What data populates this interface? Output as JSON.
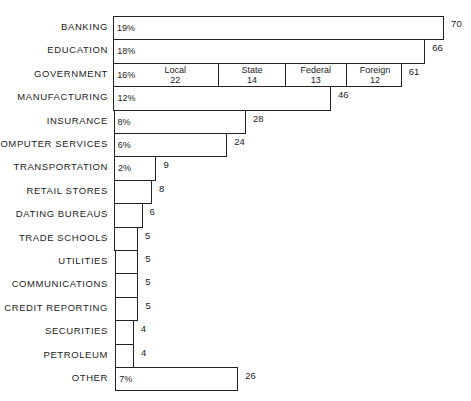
{
  "chart_data": {
    "type": "bar",
    "orientation": "horizontal",
    "title": "",
    "xlabel": "",
    "ylabel": "",
    "grid": false,
    "xlim": [
      0,
      70
    ],
    "categories": [
      "BANKING",
      "EDUCATION",
      "GOVERNMENT",
      "MANUFACTURING",
      "INSURANCE",
      "COMPUTER SERVICES",
      "TRANSPORTATION",
      "RETAIL STORES",
      "DATING BUREAUS",
      "TRADE SCHOOLS",
      "UTILITIES",
      "COMMUNICATIONS",
      "CREDIT REPORTING",
      "SECURITIES",
      "PETROLEUM",
      "OTHER"
    ],
    "values": [
      70,
      66,
      61,
      46,
      28,
      24,
      9,
      8,
      6,
      5,
      5,
      5,
      5,
      4,
      4,
      26
    ],
    "percent_labels": [
      "19%",
      "18%",
      "16%",
      "12%",
      "8%",
      "6%",
      "2%",
      "",
      "",
      "",
      "",
      "",
      "",
      "",
      "",
      "7%"
    ],
    "government_breakdown": [
      {
        "name": "Local",
        "value": 22
      },
      {
        "name": "State",
        "value": 14
      },
      {
        "name": "Federal",
        "value": 13
      },
      {
        "name": "Foreign",
        "value": 12
      }
    ]
  },
  "layout": {
    "x0": 113,
    "scale": 4.73,
    "top": 16,
    "row": 23.4,
    "bar_h": 22
  }
}
